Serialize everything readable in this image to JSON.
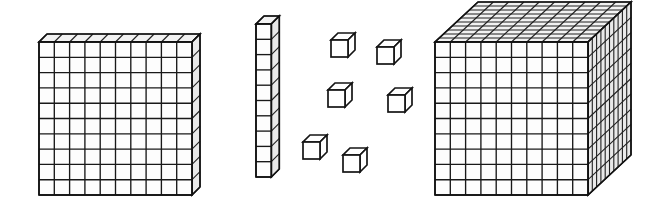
{
  "scene": {
    "title": "Base ten blocks",
    "description": "Place value manipulatives: a hundreds flat, a tens rod, six unit cubes, and a thousands cube",
    "background_color": "#ffffff",
    "line_color": "#1b1b1b",
    "fill_color": "#ffffff",
    "width": 663,
    "height": 215
  },
  "blocks": [
    {
      "id": "hundreds-flat",
      "name": "hundreds-flat",
      "label": "Flat",
      "place_value": "hundreds",
      "value": 100,
      "unit_count": 100,
      "columns": 10,
      "rows": 10,
      "depth_units": 1,
      "x": 39,
      "y": 42,
      "cell": 15.3,
      "depth_x": 8,
      "depth_y": -8
    },
    {
      "id": "tens-rod",
      "name": "tens-rod",
      "label": "Rod",
      "place_value": "tens",
      "value": 10,
      "unit_count": 10,
      "columns": 1,
      "rows": 10,
      "depth_units": 1,
      "x": 256,
      "y": 24,
      "cell": 15.3,
      "depth_x": 8,
      "depth_y": -8
    },
    {
      "id": "thousands-cube",
      "name": "thousands-cube",
      "label": "Cube",
      "place_value": "thousands",
      "value": 1000,
      "unit_count": 1000,
      "columns": 10,
      "rows": 10,
      "depth_units": 10,
      "x": 435,
      "y": 42,
      "cell": 15.3,
      "depth_x": 43,
      "depth_y": -40
    }
  ],
  "unit_cubes": {
    "id": "ones-units",
    "name": "ones-unit-cubes",
    "label": "Units",
    "place_value": "ones",
    "value": 1,
    "count": 6,
    "size": 17,
    "depth_x": 7,
    "depth_y": -7,
    "positions": [
      {
        "x": 331,
        "y": 40
      },
      {
        "x": 377,
        "y": 47
      },
      {
        "x": 328,
        "y": 90
      },
      {
        "x": 388,
        "y": 95
      },
      {
        "x": 303,
        "y": 142
      },
      {
        "x": 343,
        "y": 155
      }
    ]
  },
  "totals": {
    "thousands": 1,
    "hundreds": 1,
    "tens": 1,
    "ones": 6,
    "sum": 1116
  }
}
